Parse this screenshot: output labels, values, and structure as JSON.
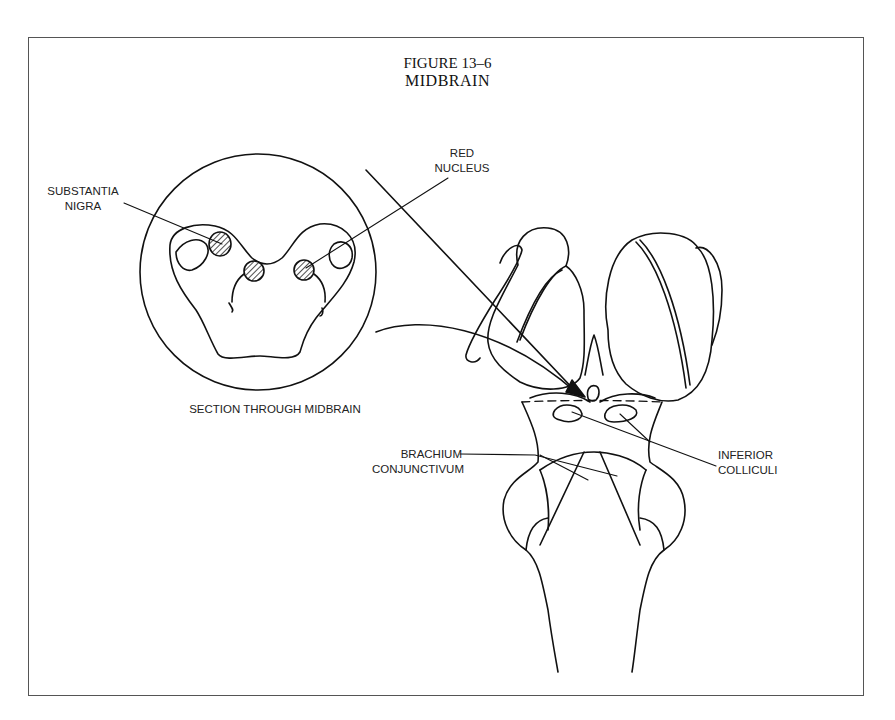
{
  "figure": {
    "number": "FIGURE 13–6",
    "title": "MIDBRAIN"
  },
  "labels": {
    "substantia_nigra": [
      "SUBSTANTIA",
      "NIGRA"
    ],
    "red_nucleus": [
      "RED",
      "NUCLEUS"
    ],
    "section_caption": "SECTION THROUGH MIDBRAIN",
    "brachium_conjunctivum": [
      "BRACHIUM",
      "CONJUNCTIVUM"
    ],
    "inferior_colliculi": [
      "INFERIOR",
      "COLLICULI"
    ]
  },
  "colors": {
    "line": "#111111",
    "frame": "#555555",
    "background": "#ffffff"
  }
}
